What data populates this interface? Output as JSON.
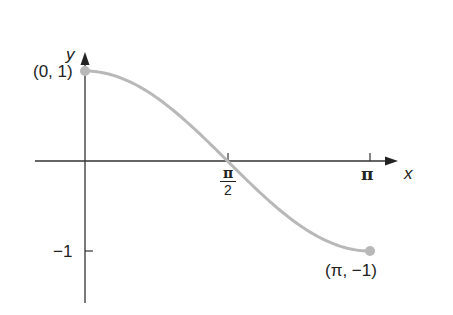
{
  "chart_data": {
    "type": "line",
    "title": "",
    "function": "y = cos(x)",
    "xlabel": "x",
    "ylabel": "y",
    "xlim": [
      0,
      3.14159
    ],
    "ylim": [
      -1,
      1
    ],
    "x_ticks": [
      {
        "value": 1.5708,
        "label_num": "π",
        "label_den": "2"
      },
      {
        "value": 3.14159,
        "label": "π"
      }
    ],
    "y_ticks": [
      {
        "value": 1,
        "label": ""
      },
      {
        "value": -1,
        "label": "−1"
      }
    ],
    "points": [
      {
        "x": 0,
        "y": 1,
        "label": "(0, 1)"
      },
      {
        "x": 3.14159,
        "y": -1,
        "label": "(π, −1)"
      }
    ],
    "grid": false,
    "legend": null,
    "colors": {
      "axis": "#333333",
      "curve": "#b8b8b8",
      "text": "#222222"
    }
  },
  "labels": {
    "y_axis": "y",
    "x_axis": "x",
    "start_point": "(0, 1)",
    "end_point": "(π, −1)",
    "tick_pi": "π",
    "tick_pi_half_num": "π",
    "tick_pi_half_den": "2",
    "tick_neg_one": "−1"
  }
}
